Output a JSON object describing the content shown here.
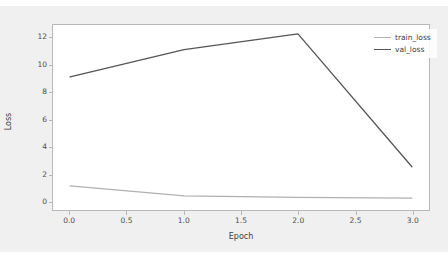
{
  "chart_data": {
    "type": "line",
    "title": "",
    "xlabel": "Epoch",
    "ylabel": "Loss",
    "x": [
      0.0,
      1.0,
      2.0,
      3.0
    ],
    "xlim": [
      -0.15,
      3.15
    ],
    "ylim": [
      -0.62,
      12.95
    ],
    "grid": false,
    "legend_position": "upper right",
    "xticks": [
      "0.0",
      "0.5",
      "1.0",
      "1.5",
      "2.0",
      "2.5",
      "3.0"
    ],
    "xtick_values": [
      0.0,
      0.5,
      1.0,
      1.5,
      2.0,
      2.5,
      3.0
    ],
    "yticks": [
      "0",
      "2",
      "4",
      "6",
      "8",
      "10",
      "12"
    ],
    "ytick_values": [
      0,
      2,
      4,
      6,
      8,
      10,
      12
    ],
    "series": [
      {
        "name": "train_loss",
        "color": "#b0b0b0",
        "values": [
          1.15,
          0.42,
          0.3,
          0.25
        ]
      },
      {
        "name": "val_loss",
        "color": "#555555",
        "values": [
          9.15,
          11.15,
          12.3,
          2.55
        ]
      }
    ]
  },
  "figure": {
    "background": "#f0f0f0",
    "axes_background": "#ffffff",
    "axes_edge_color": "#b9b9b9"
  },
  "legend": {
    "items": [
      {
        "label": "train_loss"
      },
      {
        "label": "val_loss"
      }
    ]
  }
}
